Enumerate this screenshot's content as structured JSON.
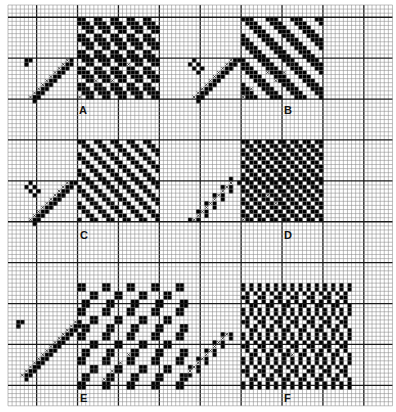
{
  "figure": {
    "grid": {
      "cols": 94,
      "rows": 98,
      "major_every": 10,
      "major_col_offset": 7,
      "major_row_offset": 3
    },
    "colors": {
      "paper": "#ffffff",
      "fine_line": "#8a8a8a",
      "major_line": "#1a1a1a",
      "fill": "#000000",
      "cross": "#222222"
    },
    "panels": [
      {
        "label": "A",
        "threading": "twill",
        "pattern": [
          "1100",
          "1110",
          "0111",
          "0011"
        ],
        "col": 17,
        "row": 3,
        "w": 20,
        "h": 20,
        "tie": {
          "col": 5,
          "row": 13,
          "size": 10,
          "shape": "hook"
        }
      },
      {
        "label": "B",
        "threading": "twill",
        "pattern": [
          "111000",
          "011100",
          "001110",
          "000111",
          "100011",
          "110001"
        ],
        "col": 57,
        "row": 3,
        "w": 20,
        "h": 20,
        "tie": {
          "col": 45,
          "row": 13,
          "size": 10,
          "shape": "band"
        }
      },
      {
        "label": "C",
        "threading": "twill",
        "pattern": [
          "1100",
          "0110",
          "0011",
          "1001"
        ],
        "col": 17,
        "row": 33,
        "w": 20,
        "h": 20,
        "tie": {
          "col": 5,
          "row": 43,
          "size": 10,
          "shape": "band"
        }
      },
      {
        "label": "D",
        "threading": "twill",
        "pattern": [
          "110",
          "011",
          "101"
        ],
        "col": 57,
        "row": 33,
        "w": 20,
        "h": 20,
        "tie": {
          "col": 45,
          "row": 43,
          "size": 10,
          "shape": "checker"
        }
      },
      {
        "label": "E",
        "threading": "spot",
        "pattern": [
          "110000",
          "110000",
          "000110",
          "000110",
          "011000",
          "011000"
        ],
        "col": 17,
        "row": 68,
        "w": 27,
        "h": 26,
        "tie": {
          "col": 3,
          "row": 77,
          "size": 14,
          "shape": "hook"
        }
      },
      {
        "label": "F",
        "threading": "broken",
        "pattern": [
          "1010",
          "1010",
          "0101",
          "1100",
          "0101",
          "0011"
        ],
        "col": 57,
        "row": 68,
        "w": 27,
        "h": 26,
        "tie": {
          "col": 43,
          "row": 80,
          "size": 11,
          "shape": "checker"
        }
      }
    ]
  }
}
